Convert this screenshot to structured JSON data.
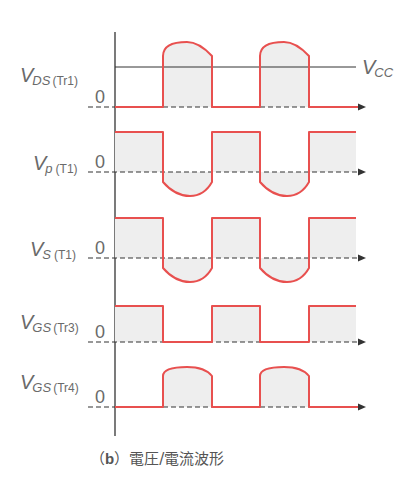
{
  "diagram": {
    "caption_prefix": "（b）",
    "caption_label": "b",
    "caption_text": "電圧/電流波形",
    "colors": {
      "waveform": "#e8504f",
      "fill": "#eeeeee",
      "axis": "#333333",
      "label": "#6a6a6a"
    },
    "vcc_label": "V",
    "vcc_sub": "CC",
    "traces": [
      {
        "id": "vds-tr1",
        "main": "V",
        "sub": "DS",
        "paren": "(Tr1)",
        "zero": "0",
        "shape": "domes-above-vcc"
      },
      {
        "id": "vp-t1",
        "main": "V",
        "sub": "p",
        "paren": "(T1)",
        "zero": "0",
        "shape": "square-with-negative-domes"
      },
      {
        "id": "vs-t1",
        "main": "V",
        "sub": "S",
        "paren": "(T1)",
        "zero": "0",
        "shape": "square-with-negative-domes"
      },
      {
        "id": "vgs-tr3",
        "main": "V",
        "sub": "GS",
        "paren": "(Tr3)",
        "zero": "0",
        "shape": "square"
      },
      {
        "id": "vgs-tr4",
        "main": "V",
        "sub": "GS",
        "paren": "(Tr4)",
        "zero": "0",
        "shape": "domes"
      }
    ]
  }
}
